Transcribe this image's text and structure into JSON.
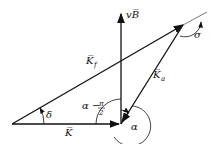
{
  "diagram": {
    "type": "vector-triangle",
    "labels": {
      "vB": "vB̅",
      "Kf": "K̅",
      "Kf_sub": "f",
      "Ka": "K̅",
      "Ka_sub": "a",
      "K": "K̅",
      "delta": "δ",
      "alpha": "α",
      "sigma": "σ",
      "alpha_minus": "α −",
      "pi": "π",
      "two": "2"
    },
    "colors": {
      "stroke": "#111111",
      "background": "#ffffff"
    }
  }
}
